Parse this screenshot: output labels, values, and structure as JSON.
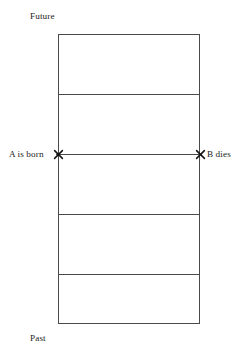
{
  "diagram": {
    "background_color": "#ffffff",
    "line_color": "#4a4a4a",
    "text_color": "#1d1d1d",
    "axis_labels": {
      "top": "Future",
      "bottom": "Past"
    },
    "events": [
      {
        "id": "a-born",
        "label": "A is born",
        "marker": "x-marker",
        "side": "left"
      },
      {
        "id": "b-dies",
        "label": "B dies",
        "marker": "x-marker",
        "side": "right"
      }
    ],
    "frame": {
      "bands": 5,
      "divider_count": 3
    }
  }
}
